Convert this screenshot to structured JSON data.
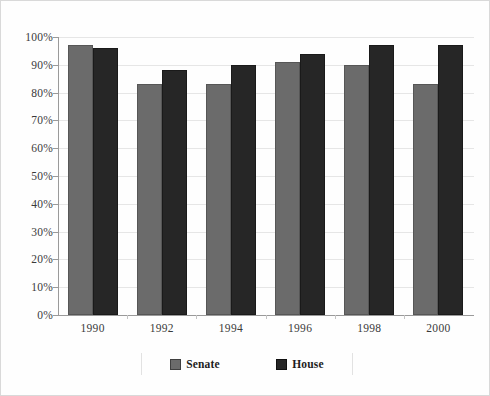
{
  "chart_data": {
    "type": "bar",
    "title": "",
    "subtitle": "",
    "xlabel": "",
    "ylabel": "",
    "categories": [
      "1990",
      "1992",
      "1994",
      "1996",
      "1998",
      "2000"
    ],
    "series": [
      {
        "name": "Senate",
        "color": "#6b6b6b",
        "values": [
          97,
          83,
          83,
          91,
          90,
          83
        ]
      },
      {
        "name": "House",
        "color": "#262626",
        "values": [
          96,
          88,
          90,
          94,
          97,
          97
        ]
      }
    ],
    "ylim": [
      0,
      100
    ],
    "ytick_labels": [
      "0%",
      "10%",
      "20%",
      "30%",
      "40%",
      "50%",
      "60%",
      "70%",
      "80%",
      "90%",
      "100%"
    ],
    "ytick_values": [
      0,
      10,
      20,
      30,
      40,
      50,
      60,
      70,
      80,
      90,
      100
    ],
    "grid": true,
    "grid_axis": "y",
    "legend_position": "bottom",
    "legend_entries": [
      "Senate",
      "House"
    ],
    "value_format": "percent",
    "background_color": "#fefefe",
    "axis_color": "#9a9a9a",
    "grid_color": "#e6e6e6",
    "border_color": "#d9d9d9"
  }
}
